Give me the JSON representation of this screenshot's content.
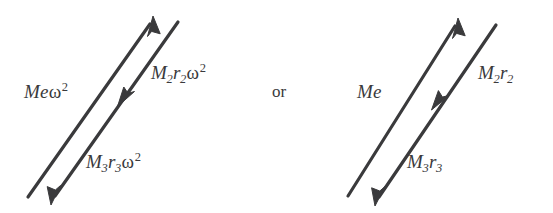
{
  "figure": {
    "background_color": "#ffffff",
    "ink_color": "#3a3a3c",
    "width": 553,
    "height": 213
  },
  "conjunction": {
    "text": "or"
  },
  "diagrams": [
    {
      "id": "with-omega-squared",
      "labels": {
        "primary": {
          "base": "Me",
          "symbol": "ω",
          "exponent": "2",
          "full_text": "Meω²"
        },
        "upper": {
          "m_letter": "M",
          "m_sub": "2",
          "r_letter": "r",
          "r_sub": "2",
          "symbol": "ω",
          "exponent": "2",
          "full_text": "M₂r₂ω²"
        },
        "lower": {
          "m_letter": "M",
          "m_sub": "3",
          "r_letter": "r",
          "r_sub": "3",
          "symbol": "ω",
          "exponent": "2",
          "full_text": "M₃r₃ω²"
        }
      },
      "vectors": [
        {
          "name": "resultant-up-vector",
          "from": [
            28,
            197
          ],
          "to": [
            152,
            21
          ],
          "arrowheads": [
            "end"
          ],
          "direction": "up-right"
        },
        {
          "name": "component-down-vector",
          "from": [
            178,
            22
          ],
          "to": [
            54,
            198
          ],
          "arrowheads": [
            "mid",
            "end"
          ],
          "direction": "down-left"
        }
      ]
    },
    {
      "id": "without-omega-squared",
      "labels": {
        "primary": {
          "base": "Me",
          "symbol": "",
          "exponent": "",
          "full_text": "Me"
        },
        "upper": {
          "m_letter": "M",
          "m_sub": "2",
          "r_letter": "r",
          "r_sub": "2",
          "symbol": "",
          "exponent": "",
          "full_text": "M₂r₂"
        },
        "lower": {
          "m_letter": "M",
          "m_sub": "3",
          "r_letter": "r",
          "r_sub": "3",
          "symbol": "",
          "exponent": "",
          "full_text": "M₃r₃"
        }
      },
      "vectors": [
        {
          "name": "resultant-up-vector",
          "from": [
            348,
            196
          ],
          "to": [
            457,
            23
          ],
          "arrowheads": [
            "end"
          ],
          "direction": "up-right"
        },
        {
          "name": "component-down-vector",
          "from": [
            496,
            25
          ],
          "to": [
            378,
            199
          ],
          "arrowheads": [
            "mid",
            "end"
          ],
          "direction": "down-left"
        }
      ]
    }
  ]
}
